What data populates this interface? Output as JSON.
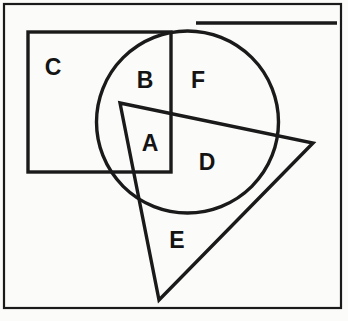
{
  "figure": {
    "title": "",
    "background_color": "#fbfbf9",
    "stroke_color": "#1a1a1a",
    "canvas": {
      "width": 348,
      "height": 321
    },
    "frame": {
      "name": "outer-border",
      "x": 4,
      "y": 4,
      "width": 337,
      "height": 304,
      "stroke_width": 2.2
    },
    "top_rule": {
      "name": "top-horizontal-rule",
      "x1": 196,
      "y1": 23,
      "x2": 337,
      "y2": 23,
      "stroke_width": 3.4
    },
    "shapes": [
      {
        "id": "square",
        "kind": "rectangle",
        "x": 28,
        "y": 32,
        "width": 143,
        "height": 140,
        "stroke_width": 3.4
      },
      {
        "id": "circle",
        "kind": "circle",
        "cx": 187.5,
        "cy": 122,
        "r": 91,
        "stroke_width": 3.4
      },
      {
        "id": "triangle",
        "kind": "triangle",
        "points": "120,103 313,143 159,300",
        "vertices": [
          {
            "x": 120,
            "y": 103
          },
          {
            "x": 313,
            "y": 143
          },
          {
            "x": 159,
            "y": 300
          }
        ],
        "stroke_width": 3.4
      }
    ],
    "labels": [
      {
        "id": "label-a",
        "text": "A",
        "x": 150,
        "y": 143
      },
      {
        "id": "label-b",
        "text": "B",
        "x": 145,
        "y": 80
      },
      {
        "id": "label-c",
        "text": "C",
        "x": 53,
        "y": 67
      },
      {
        "id": "label-d",
        "text": "D",
        "x": 207,
        "y": 162
      },
      {
        "id": "label-e",
        "text": "E",
        "x": 177,
        "y": 240
      },
      {
        "id": "label-f",
        "text": "F",
        "x": 198,
        "y": 80
      }
    ]
  }
}
